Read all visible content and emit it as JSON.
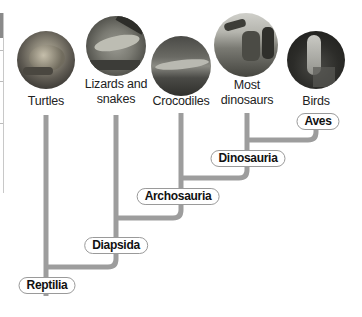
{
  "diagram": {
    "type": "cladogram",
    "colors": {
      "branch": "#9d9d9d",
      "label_border": "#9a9a9a",
      "label_text": "#111111",
      "taxon_text": "#222222"
    },
    "taxa": [
      {
        "id": "turtles",
        "label": "Turtles",
        "photo": "turtle-photo"
      },
      {
        "id": "lizards",
        "label_line1": "Lizards and",
        "label_line2": "snakes",
        "photo": "lizard-photo"
      },
      {
        "id": "crocodiles",
        "label": "Crocodiles",
        "photo": "crocodile-photo"
      },
      {
        "id": "dinosaurs",
        "label_line1": "Most",
        "label_line2": "dinosaurs",
        "photo": "dinosaur-photo"
      },
      {
        "id": "birds",
        "label": "Birds",
        "photo": "bird-photo"
      }
    ],
    "clades": [
      {
        "id": "aves",
        "label": "Aves"
      },
      {
        "id": "dinosauria",
        "label": "Dinosauria"
      },
      {
        "id": "archosauria",
        "label": "Archosauria"
      },
      {
        "id": "diapsida",
        "label": "Diapsida"
      },
      {
        "id": "reptilia",
        "label": "Reptilia"
      }
    ]
  }
}
